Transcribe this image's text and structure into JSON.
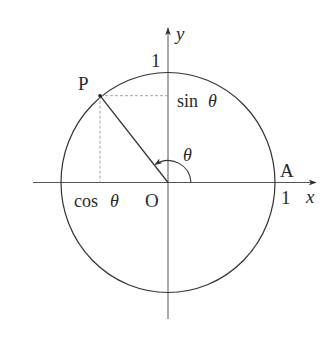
{
  "diagram": {
    "type": "unit-circle",
    "labels": {
      "y_axis": "y",
      "x_axis": "x",
      "y_unit": "1",
      "x_unit": "1",
      "point_p": "P",
      "point_a": "A",
      "origin": "O",
      "sin": "sin",
      "cos": "cos",
      "theta": "θ"
    },
    "geometry": {
      "origin": [
        168,
        182.5
      ],
      "radius_x": 107,
      "radius_y": 110,
      "point_p": [
        100,
        95.7
      ],
      "point_a": [
        275,
        182.5
      ],
      "angle_deg": 128,
      "angle_arc_radius": 23
    },
    "colors": {
      "stroke": "#333333",
      "axis": "#555555",
      "dashed": "#9a9a9a",
      "text": "#2a2a2a",
      "background": "#ffffff"
    }
  }
}
